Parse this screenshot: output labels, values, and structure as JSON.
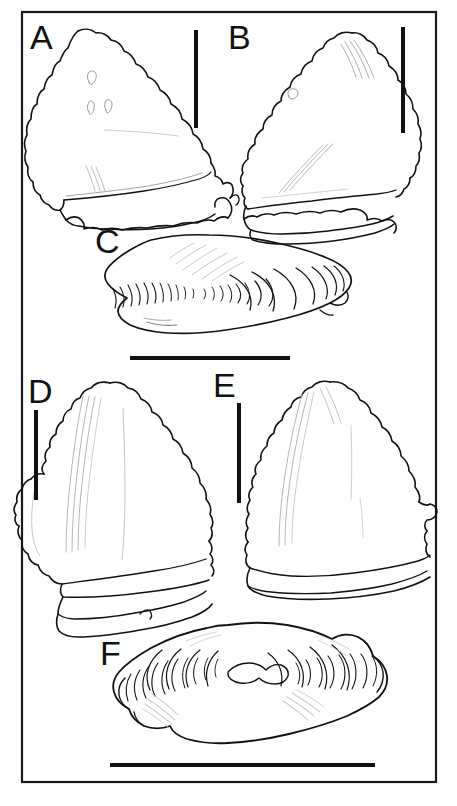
{
  "figure": {
    "type": "scientific-line-drawing-plate",
    "medium": "ink line drawing, black on white",
    "frame": {
      "present": true,
      "shape": "rectangle",
      "stroke_color": "#1a1a1a",
      "stroke_width_px": 2,
      "x": 21,
      "y": 11,
      "width": 416,
      "height": 772
    },
    "background_color": "#ffffff",
    "ink_color": "#111111",
    "panel_count": 6
  },
  "panels": [
    {
      "id": "A",
      "label": "A",
      "label_x": 30,
      "label_y": 24,
      "view": "crown, labial view",
      "description": "Broad asymmetric triangular crown with coarsely crenulated mesial and distal cutting edges, low root with irregular basal margin, several small foramina on the crown face.",
      "scale_bar": {
        "orientation": "vertical",
        "x": 196,
        "y1": 30,
        "y2": 128,
        "length_px": 98,
        "thickness_px": 4,
        "color": "#111111"
      }
    },
    {
      "id": "B",
      "label": "B",
      "label_x": 228,
      "label_y": 24,
      "view": "crown, lingual view",
      "description": "Tall asymmetric triangular crown with serrated edges, distinct apical ridges, and a thick bilobed root beneath.",
      "scale_bar": {
        "orientation": "vertical",
        "x": 403,
        "y1": 27,
        "y2": 133,
        "length_px": 106,
        "thickness_px": 4,
        "color": "#111111"
      }
    },
    {
      "id": "C",
      "label": "C",
      "label_x": 95,
      "label_y": 228,
      "view": "basal / root view",
      "description": "Elongate lenticular root outline with nested concentric arc striations along the lower margin and fine oblique hatching on the upper left field.",
      "scale_bar": {
        "orientation": "horizontal",
        "y": 358,
        "x1": 130,
        "x2": 290,
        "length_px": 160,
        "thickness_px": 4,
        "color": "#111111"
      }
    },
    {
      "id": "D",
      "label": "D",
      "label_x": 28,
      "label_y": 378,
      "view": "crown, labial view",
      "description": "Triangular crown with finely serrated distal edge, a broad rounded lateral cusplet on the mesial side, longitudinal enameloid folds, and a flattened root.",
      "scale_bar": {
        "orientation": "vertical",
        "x": 36,
        "y1": 410,
        "y2": 500,
        "length_px": 90,
        "thickness_px": 4,
        "color": "#111111"
      }
    },
    {
      "id": "E",
      "label": "E",
      "label_x": 213,
      "label_y": 372,
      "view": "crown, lingual view",
      "description": "Triangular crown, serrated along both cutting edges, with a small distal heel and a broad low root.",
      "scale_bar": {
        "orientation": "vertical",
        "x": 239,
        "y1": 403,
        "y2": 503,
        "length_px": 100,
        "thickness_px": 4,
        "color": "#111111"
      }
    },
    {
      "id": "F",
      "label": "F",
      "label_x": 100,
      "label_y": 640,
      "view": "basal / root view",
      "description": "Symmetrical lozenge-shaped root with a central raised boss and radiating nested arc striations spreading to both lateral tips.",
      "scale_bar": {
        "orientation": "horizontal",
        "y": 765,
        "x1": 110,
        "x2": 375,
        "length_px": 265,
        "thickness_px": 4,
        "color": "#111111"
      }
    }
  ]
}
